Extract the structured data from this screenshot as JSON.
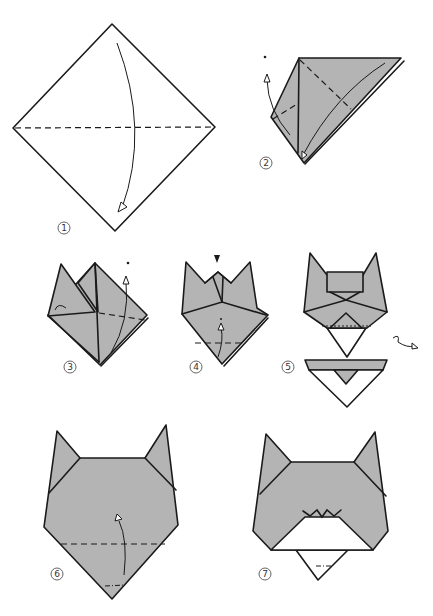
{
  "diagram": {
    "colors": {
      "paper": "#b4b4b4",
      "line": "#1a1a1a",
      "background": "#ffffff"
    },
    "steps": [
      {
        "id": 1,
        "label": "1",
        "description": "Square diamond; valley fold in half top to bottom"
      },
      {
        "id": 2,
        "label": "2",
        "description": "Triangle; valley fold corners up"
      },
      {
        "id": 3,
        "label": "3",
        "description": "Fold second ear up"
      },
      {
        "id": 4,
        "label": "4",
        "description": "Squash top, fold bottom point up"
      },
      {
        "id": 5,
        "label": "5",
        "description": "Fold bottom flap; turn over"
      },
      {
        "id": 6,
        "label": "6",
        "description": "Cat head shape; fold bottom tip up"
      },
      {
        "id": 7,
        "label": "7",
        "description": "Finished cat face"
      }
    ]
  }
}
